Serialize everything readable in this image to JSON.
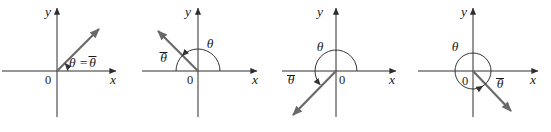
{
  "figure": {
    "background_color": "#ffffff",
    "axis_color": "#2e2e2e",
    "ray_color": "#696969",
    "arc_color": "#333333",
    "label_color": "#1c1c1c"
  },
  "panels": [
    {
      "id": "quadrant-1",
      "y_axis_label": "y",
      "x_axis_label": "x",
      "origin_label": "0",
      "angle_label_prefix": "θ =",
      "reference_angle_symbol": "θ"
    },
    {
      "id": "quadrant-2",
      "y_axis_label": "y",
      "x_axis_label": "x",
      "origin_label": "0",
      "angle_symbol": "θ",
      "reference_angle_symbol": "θ"
    },
    {
      "id": "quadrant-3",
      "y_axis_label": "y",
      "x_axis_label": "x",
      "origin_label": "0",
      "angle_symbol": "θ",
      "reference_angle_symbol": "θ"
    },
    {
      "id": "quadrant-4",
      "y_axis_label": "y",
      "x_axis_label": "x",
      "origin_label": "0",
      "angle_symbol": "θ",
      "reference_angle_symbol": "θ"
    }
  ]
}
